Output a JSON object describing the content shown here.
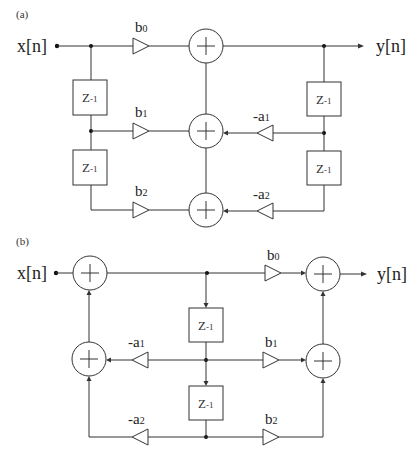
{
  "diagram": {
    "type": "IIR biquad filter signal flow graphs",
    "colors": {
      "line": "#333333",
      "background": "#ffffff"
    },
    "panels": [
      {
        "label": "(a)",
        "structure": "direct-form-I",
        "input": "x[n]",
        "output": "y[n]",
        "delays": [
          {
            "base": "Z",
            "exp": "-1"
          },
          {
            "base": "Z",
            "exp": "-1"
          },
          {
            "base": "Z",
            "exp": "-1"
          },
          {
            "base": "Z",
            "exp": "-1"
          }
        ],
        "feedforward": [
          {
            "base": "b",
            "sub": "0"
          },
          {
            "base": "b",
            "sub": "1"
          },
          {
            "base": "b",
            "sub": "2"
          }
        ],
        "feedback": [
          {
            "base": "-a",
            "sub": "1"
          },
          {
            "base": "-a",
            "sub": "2"
          }
        ],
        "adders": 3
      },
      {
        "label": "(b)",
        "structure": "direct-form-II",
        "input": "x[n]",
        "output": "y[n]",
        "delays": [
          {
            "base": "Z",
            "exp": "-1"
          },
          {
            "base": "Z",
            "exp": "-1"
          }
        ],
        "feedforward": [
          {
            "base": "b",
            "sub": "0"
          },
          {
            "base": "b",
            "sub": "1"
          },
          {
            "base": "b",
            "sub": "2"
          }
        ],
        "feedback": [
          {
            "base": "-a",
            "sub": "1"
          },
          {
            "base": "-a",
            "sub": "2"
          }
        ],
        "adders": 4
      }
    ]
  }
}
